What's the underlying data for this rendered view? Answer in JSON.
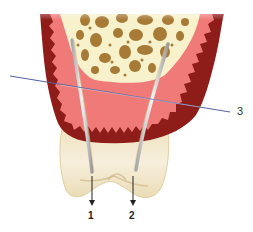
{
  "diagram": {
    "labels": [
      {
        "id": "1",
        "text": "1",
        "x": 88,
        "y": 211
      },
      {
        "id": "2",
        "text": "2",
        "x": 129,
        "y": 211
      },
      {
        "id": "3",
        "text": "3",
        "x": 237,
        "y": 106
      }
    ],
    "colors": {
      "outer_tissue": "#8e1c18",
      "inner_tissue": "#f07a78",
      "bone": "#f7f2cc",
      "trabeculae": "#a77a35",
      "crown": "#f3ead0",
      "crown_shadow": "#e2d3a8",
      "root_canal": "#c9c9c9",
      "line3": "#5560a0",
      "arrow": "#222222"
    },
    "line3": {
      "x1": 10,
      "y1": 76,
      "x2": 230,
      "y2": 112
    },
    "arrows": [
      {
        "id": "1",
        "x": 92,
        "y1": 176,
        "y2": 206
      },
      {
        "id": "2",
        "x": 133,
        "y1": 176,
        "y2": 206
      }
    ]
  }
}
